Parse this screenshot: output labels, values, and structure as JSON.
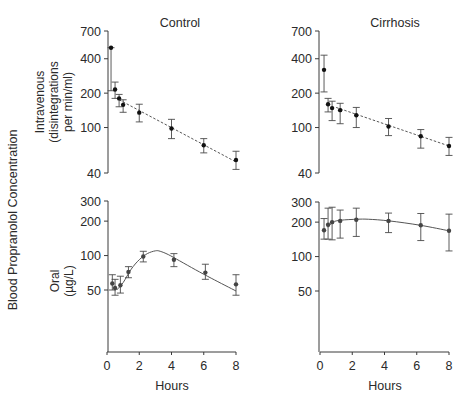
{
  "figure": {
    "y_label_main": "Blood Propranolol Concentration",
    "row_labels": {
      "iv": [
        "Intravenous",
        "(disintegrations",
        "per min/ml)"
      ],
      "oral": [
        "Oral",
        "(µg/L)"
      ]
    },
    "column_titles": [
      "Control",
      "Cirrhosis"
    ],
    "xlabel": "Hours"
  },
  "chart_data": [
    {
      "type": "scatter",
      "panel": "iv-control",
      "title": "Control",
      "ylabel": "Intravenous (disintegrations per min/ml)",
      "xlabel": "",
      "yscale": "log",
      "ylim": [
        40,
        700
      ],
      "yticks": [
        40,
        100,
        200,
        400,
        700
      ],
      "xlim": [
        0,
        8
      ],
      "fit": "dashed",
      "x": [
        0.25,
        0.5,
        0.75,
        1.0,
        2.0,
        4.0,
        6.0,
        8.0
      ],
      "values": [
        500,
        215,
        180,
        158,
        135,
        98,
        70,
        52
      ],
      "err_low": [
        210,
        180,
        152,
        136,
        112,
        80,
        60,
        43
      ],
      "err_high": [
        500,
        250,
        195,
        175,
        160,
        118,
        80,
        62
      ]
    },
    {
      "type": "scatter",
      "panel": "iv-cirrhosis",
      "title": "Cirrhosis",
      "ylabel": "",
      "xlabel": "",
      "yscale": "log",
      "ylim": [
        40,
        700
      ],
      "yticks": [
        40,
        100,
        200,
        400,
        700
      ],
      "xlim": [
        0,
        8
      ],
      "fit": "dashed",
      "x": [
        0.25,
        0.5,
        0.75,
        1.25,
        2.25,
        4.25,
        6.25,
        8.0
      ],
      "values": [
        320,
        160,
        148,
        142,
        128,
        102,
        84,
        69
      ],
      "err_low": [
        205,
        137,
        115,
        108,
        100,
        85,
        66,
        57
      ],
      "err_high": [
        430,
        180,
        170,
        163,
        150,
        120,
        96,
        82
      ]
    },
    {
      "type": "scatter",
      "panel": "oral-control",
      "title": "",
      "ylabel": "Oral (µg/L)",
      "xlabel": "Hours",
      "yscale": "log",
      "ylim": [
        15,
        300
      ],
      "yticks": [
        50,
        100,
        200,
        300
      ],
      "xlim": [
        0,
        8
      ],
      "xticks": [
        0,
        2,
        4,
        6,
        8
      ],
      "fit": "solid",
      "x": [
        0.33,
        0.5,
        0.83,
        1.33,
        2.25,
        4.15,
        6.1,
        8.0
      ],
      "values": [
        57,
        52,
        55,
        72,
        98,
        92,
        71,
        56
      ],
      "err_low": [
        50,
        45,
        47,
        64,
        88,
        80,
        62,
        45
      ],
      "err_high": [
        68,
        62,
        66,
        80,
        109,
        104,
        84,
        68
      ]
    },
    {
      "type": "scatter",
      "panel": "oral-cirrhosis",
      "title": "",
      "ylabel": "",
      "xlabel": "Hours",
      "yscale": "log",
      "ylim": [
        15,
        300
      ],
      "yticks": [
        50,
        100,
        200,
        300
      ],
      "xlim": [
        0,
        8
      ],
      "xticks": [
        0,
        2,
        4,
        6,
        8
      ],
      "fit": "solid",
      "x": [
        0.25,
        0.5,
        0.75,
        1.25,
        2.25,
        4.25,
        6.25,
        8.0
      ],
      "values": [
        170,
        190,
        200,
        205,
        210,
        205,
        188,
        168
      ],
      "err_low": [
        142,
        142,
        140,
        145,
        150,
        162,
        138,
        112
      ],
      "err_high": [
        215,
        265,
        270,
        255,
        265,
        240,
        238,
        235
      ]
    }
  ],
  "fits": {
    "iv-control": [
      [
        0.75,
        175
      ],
      [
        8.0,
        50
      ]
    ],
    "iv-cirrhosis": [
      [
        1.0,
        150
      ],
      [
        8.0,
        69
      ]
    ],
    "oral-control": [
      [
        0.6,
        50
      ],
      [
        1.0,
        58
      ],
      [
        1.5,
        76
      ],
      [
        2.0,
        92
      ],
      [
        2.5,
        104
      ],
      [
        3.0,
        110
      ],
      [
        3.3,
        109
      ],
      [
        3.8,
        102
      ],
      [
        4.5,
        90
      ],
      [
        5.5,
        75
      ],
      [
        6.5,
        63
      ],
      [
        8.0,
        49
      ]
    ],
    "oral-cirrhosis": [
      [
        0.5,
        180
      ],
      [
        0.8,
        200
      ],
      [
        1.3,
        208
      ],
      [
        2.3,
        212
      ],
      [
        3.0,
        212
      ],
      [
        4.3,
        205
      ],
      [
        6.2,
        188
      ],
      [
        8.0,
        168
      ]
    ]
  }
}
